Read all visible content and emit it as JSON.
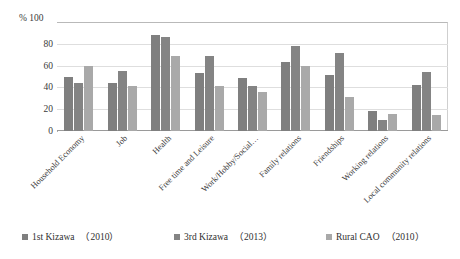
{
  "chart_data": {
    "type": "bar",
    "title": "",
    "xlabel": "",
    "ylabel": "%",
    "ylim": [
      0,
      100
    ],
    "yticks": [
      0,
      20,
      40,
      60,
      80,
      100
    ],
    "grid": true,
    "legend_position": "bottom",
    "categories": [
      "Household Economy",
      "Job",
      "Health",
      "Free time and Leisure",
      "Work/Hobby/Social…",
      "Family relations",
      "Friendships",
      "Working relations",
      "Local community relations"
    ],
    "series": [
      {
        "name": "1st Kizawa",
        "year": "（2010）",
        "color": "#7f7f7f",
        "values": [
          50,
          44,
          88,
          53,
          49,
          63,
          51,
          18,
          42
        ]
      },
      {
        "name": "3rd Kizawa",
        "year": "（2013）",
        "color": "#848484",
        "values": [
          44,
          55,
          86,
          69,
          41,
          78,
          72,
          10,
          54
        ]
      },
      {
        "name": "Rural CAO",
        "year": "（2010）",
        "color": "#a9a9a9",
        "values": [
          60,
          41,
          69,
          41,
          36,
          60,
          31,
          16,
          15
        ]
      }
    ]
  },
  "axis": {
    "percent_symbol": "%",
    "tick_100": "100",
    "tick_80": "80",
    "tick_60": "60",
    "tick_40": "40",
    "tick_20": "20",
    "tick_0": "0"
  },
  "legend": {
    "items": [
      {
        "label": "1st Kizawa",
        "year": "（2010）"
      },
      {
        "label": "3rd Kizawa",
        "year": "（2013）"
      },
      {
        "label": "Rural CAO",
        "year": "（2010）"
      }
    ]
  }
}
